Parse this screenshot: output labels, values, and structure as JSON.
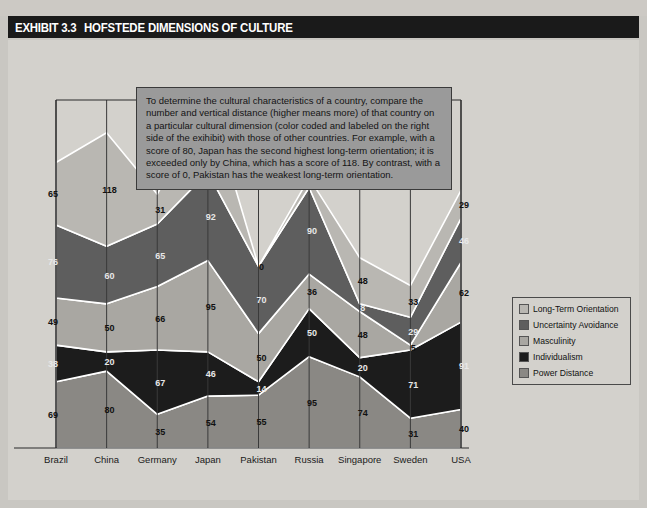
{
  "header": {
    "exhibit_tag": "EXHIBIT 3.3",
    "title": "HOFSTEDE DIMENSIONS OF CULTURE"
  },
  "callout": {
    "text": "To determine the cultural characteristics of a country, compare the number and vertical distance (higher means more) of that country on a particular cultural dimension (color coded and labeled on the right side of the exihibit) with those of other countries.  For example, with a score of 80, Japan has the second highest long-term orientation; it is exceeded only by China, which has a score of 118.  By contrast, with a score of 0, Pakistan has the weakest long-term orientation."
  },
  "legend": {
    "position": "right",
    "items": [
      {
        "label": "Long-Term Orientation",
        "color": "#b9b7b2"
      },
      {
        "label": "Uncertainty Avoidance",
        "color": "#5e5e5e"
      },
      {
        "label": "Masculinity",
        "color": "#a9a7a2"
      },
      {
        "label": "Individualism",
        "color": "#1c1c1c"
      },
      {
        "label": "Power Distance",
        "color": "#8a8884"
      }
    ]
  },
  "chart_data": {
    "type": "area",
    "stacked": true,
    "title": "HOFSTEDE DIMENSIONS OF CULTURE",
    "xlabel": "",
    "ylabel": "",
    "grid": false,
    "categories": [
      "Brazil",
      "China",
      "Germany",
      "Japan",
      "Pakistan",
      "Russia",
      "Singapore",
      "Sweden",
      "USA"
    ],
    "series": [
      {
        "name": "Power Distance",
        "color": "#8a8884",
        "values": [
          69,
          80,
          35,
          54,
          55,
          95,
          74,
          31,
          40
        ]
      },
      {
        "name": "Individualism",
        "color": "#1c1c1c",
        "values": [
          38,
          20,
          67,
          46,
          14,
          50,
          20,
          71,
          91
        ]
      },
      {
        "name": "Masculinity",
        "color": "#a9a7a2",
        "values": [
          49,
          50,
          66,
          95,
          50,
          36,
          48,
          5,
          62
        ]
      },
      {
        "name": "Uncertainty Avoidance",
        "color": "#5e5e5e",
        "values": [
          76,
          60,
          65,
          92,
          70,
          90,
          8,
          29,
          46
        ]
      },
      {
        "name": "Long-Term Orientation",
        "color": "#b9b7b2",
        "values": [
          65,
          118,
          31,
          80,
          0,
          10,
          48,
          33,
          29
        ]
      }
    ],
    "ylim": [
      0,
      360
    ]
  }
}
